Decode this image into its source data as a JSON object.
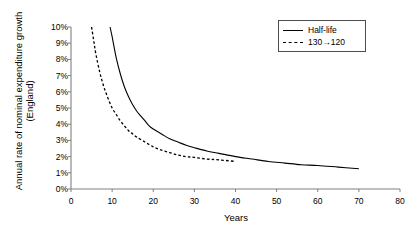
{
  "chart_data": {
    "type": "line",
    "title": "",
    "xlabel": "Years",
    "ylabel_lines": [
      "Annual rate of nominal expenditure growth",
      "(England)"
    ],
    "ylabel": "Annual rate of nominal expenditure growth (England)",
    "xlim": [
      0,
      80
    ],
    "ylim": [
      0,
      10
    ],
    "xticks": [
      0,
      10,
      20,
      30,
      40,
      50,
      60,
      70,
      80
    ],
    "xtick_labels": [
      "0",
      "10",
      "20",
      "30",
      "40",
      "50",
      "60",
      "70",
      "80"
    ],
    "yticks": [
      0,
      1,
      2,
      3,
      4,
      5,
      6,
      7,
      8,
      9,
      10
    ],
    "ytick_labels": [
      "0%",
      "1%",
      "2%",
      "3%",
      "4%",
      "5%",
      "6%",
      "7%",
      "8%",
      "9%",
      "10%"
    ],
    "y_unit": "%",
    "grid": false,
    "legend_position": "top-right",
    "series": [
      {
        "name": "Half-life",
        "style": "solid",
        "color": "#000000",
        "x": [
          9.5,
          10,
          11,
          12,
          13,
          14,
          15,
          16,
          17,
          18,
          19,
          20,
          22,
          24,
          26,
          28,
          30,
          33,
          36,
          40,
          44,
          48,
          52,
          56,
          60,
          65,
          70
        ],
        "y": [
          10.0,
          9.4,
          8.1,
          7.1,
          6.3,
          5.7,
          5.2,
          4.8,
          4.5,
          4.2,
          3.9,
          3.7,
          3.4,
          3.1,
          2.9,
          2.7,
          2.55,
          2.35,
          2.2,
          2.0,
          1.85,
          1.7,
          1.6,
          1.5,
          1.45,
          1.35,
          1.25
        ]
      },
      {
        "name": "130→120",
        "style": "dashed",
        "color": "#000000",
        "x": [
          5,
          5.5,
          6,
          7,
          8,
          9,
          10,
          11,
          12,
          13,
          14,
          15,
          16,
          18,
          20,
          22,
          24,
          26,
          28,
          30,
          33,
          36,
          40
        ],
        "y": [
          10.0,
          9.2,
          8.4,
          7.2,
          6.3,
          5.6,
          5.0,
          4.6,
          4.2,
          3.9,
          3.6,
          3.4,
          3.2,
          2.9,
          2.6,
          2.4,
          2.25,
          2.1,
          2.0,
          1.95,
          1.85,
          1.8,
          1.7
        ]
      }
    ],
    "legend": [
      {
        "label": "Half-life",
        "style": "solid"
      },
      {
        "label": "130→120",
        "style": "dashed"
      }
    ]
  }
}
